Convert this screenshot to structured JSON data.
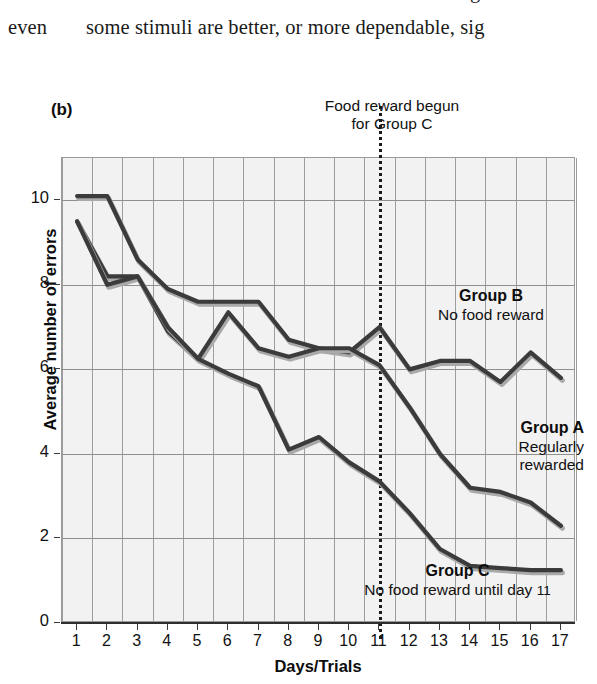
{
  "page_text": {
    "left_fragment": "even",
    "right_fragment": "some stimuli are better, or more dependable, sig",
    "clipped_descender": "g"
  },
  "figure": {
    "panel_label": "(b)",
    "event_note_line1": "Food reward begun",
    "event_note_line2": "for Group C",
    "annotations": {
      "group_b": {
        "heading": "Group B",
        "detail": "No food reward"
      },
      "group_a": {
        "heading": "Group A",
        "detail_line1": "Regularly",
        "detail_line2": "rewarded"
      },
      "group_c": {
        "heading": "Group C",
        "detail_prefix": "No food reward until day ",
        "detail_day": "11"
      }
    },
    "colors": {
      "line": "#3b3b3b",
      "line_shadow": "#a9a9a9",
      "plot_background": "#f2f2f2",
      "grid": "#9a9a9a",
      "marker_line": "#1b1b1b",
      "text": "#111111"
    }
  },
  "chart_data": {
    "type": "line",
    "title": "",
    "xlabel": "Days/Trials",
    "ylabel": "Average number of errors",
    "xlim": [
      0.5,
      17.5
    ],
    "ylim": [
      0,
      11
    ],
    "grid": true,
    "legend_position": "inline-annotations",
    "x": [
      1,
      2,
      3,
      4,
      5,
      6,
      7,
      8,
      9,
      10,
      11,
      12,
      13,
      14,
      15,
      16,
      17
    ],
    "xticks": [
      "1",
      "2",
      "3",
      "4",
      "5",
      "6",
      "7",
      "8",
      "9",
      "10",
      "11",
      "12",
      "13",
      "14",
      "15",
      "16",
      "17"
    ],
    "yticks": [
      "0",
      "2",
      "4",
      "6",
      "8",
      "10"
    ],
    "annotation_vline_x": 11,
    "annotation_vline_label": "Food reward begun for Group C",
    "series": [
      {
        "name": "Group B",
        "description": "No food reward",
        "values": [
          10.1,
          10.1,
          8.6,
          7.9,
          7.6,
          7.6,
          7.6,
          6.7,
          6.5,
          6.4,
          7.0,
          6.0,
          6.2,
          6.2,
          5.7,
          6.4,
          5.8
        ]
      },
      {
        "name": "Group A",
        "description": "Regularly rewarded",
        "values": [
          9.5,
          8.2,
          8.2,
          6.9,
          6.25,
          7.35,
          6.5,
          6.3,
          6.5,
          6.5,
          6.1,
          5.1,
          4.0,
          3.2,
          3.1,
          2.85,
          2.3
        ]
      },
      {
        "name": "Group C",
        "description": "No food reward until day 11",
        "values": [
          9.5,
          8.0,
          8.2,
          7.0,
          6.25,
          5.9,
          5.6,
          4.1,
          4.4,
          3.8,
          3.35,
          2.6,
          1.75,
          1.35,
          1.3,
          1.25,
          1.25
        ]
      }
    ]
  }
}
